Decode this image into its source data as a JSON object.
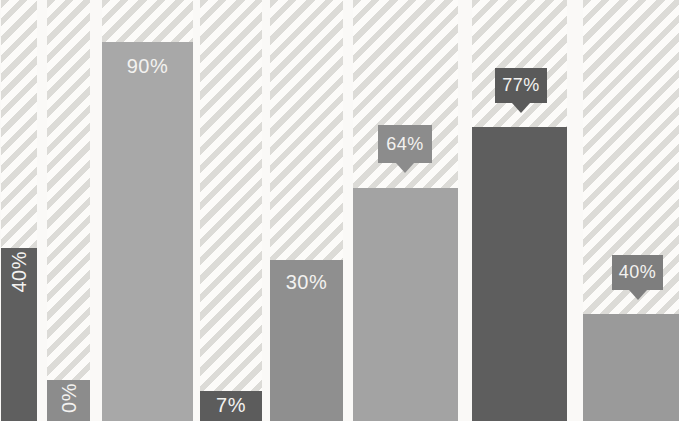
{
  "chart_data": {
    "type": "bar",
    "title": "",
    "subtitle": "",
    "xlabel": "",
    "ylabel": "",
    "unit": "percent",
    "axis_visible": false,
    "legend": "none",
    "track_max": 100,
    "categories": [
      "",
      "",
      "",
      "",
      "",
      "",
      "",
      ""
    ],
    "values": [
      40,
      0,
      90,
      7,
      30,
      64,
      77,
      40
    ],
    "canvas": {
      "width": 679,
      "height": 421
    },
    "background": {
      "page_color": "#faf9f7",
      "hatch_stripe_color": "#dcdbd7",
      "hatch_bg_color": "#fcfbf9",
      "hatch_angle_deg": 135,
      "hatch_stripe_px": 6,
      "hatch_pitch_px": 13,
      "label_text_color": "#f3f2f0"
    },
    "bars": [
      {
        "label": "40%",
        "value": 40,
        "color": "#5f5f5f",
        "label_style": "inside-vertical",
        "x": 1,
        "width": 36,
        "top": 248
      },
      {
        "label": "0%",
        "value": 0,
        "color": "#8c8c8c",
        "label_style": "inside-vertical",
        "x": 47,
        "width": 43,
        "top": 380
      },
      {
        "label": "90%",
        "value": 90,
        "color": "#a8a8a8",
        "label_style": "inside-horizontal",
        "label_pad_top": 13,
        "x": 102,
        "width": 91,
        "top": 42
      },
      {
        "label": "7%",
        "value": 7,
        "color": "#5c5c5c",
        "label_style": "inside-horizontal",
        "label_pad_top": 3,
        "x": 200,
        "width": 62,
        "top": 391
      },
      {
        "label": "30%",
        "value": 30,
        "color": "#8f8f8f",
        "label_style": "inside-horizontal",
        "label_pad_top": 11,
        "x": 270,
        "width": 73,
        "top": 260
      },
      {
        "label": "64%",
        "value": 64,
        "color": "#a3a3a3",
        "label_style": "callout",
        "x": 353,
        "width": 105,
        "top": 188,
        "callout": {
          "x": 378,
          "y": 125,
          "width": 54,
          "height": 38,
          "color": "#8c8c8c"
        }
      },
      {
        "label": "77%",
        "value": 77,
        "color": "#5e5e5e",
        "label_style": "callout",
        "x": 472,
        "width": 95,
        "top": 127,
        "callout": {
          "x": 495,
          "y": 68,
          "width": 52,
          "height": 35,
          "color": "#5a5a5a"
        }
      },
      {
        "label": "40%",
        "value": 40,
        "color": "#9a9a9a",
        "label_style": "callout",
        "x": 583,
        "width": 96,
        "top": 314,
        "callout": {
          "x": 612,
          "y": 255,
          "width": 51,
          "height": 35,
          "color": "#7e7e7e"
        }
      }
    ]
  }
}
